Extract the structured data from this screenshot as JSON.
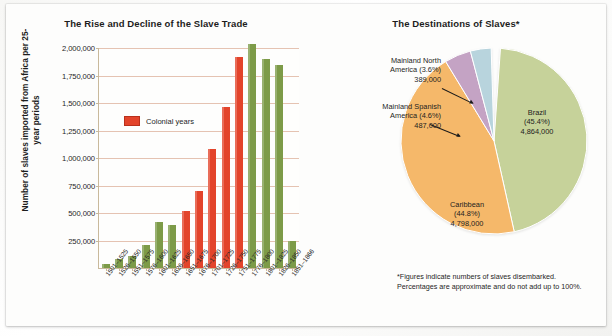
{
  "chart_data": [
    {
      "type": "bar",
      "title": "The Rise and Decline of the Slave Trade",
      "xlabel": "",
      "ylabel": "Number of slaves imported from Africa per 25-year periods",
      "ylim": [
        0,
        2000000
      ],
      "yticks": [
        "250,000",
        "500,000",
        "750,000",
        "1,000,000",
        "1,250,000",
        "1,500,000",
        "1,750,000",
        "2,000,000"
      ],
      "ytick_values": [
        250000,
        500000,
        750000,
        1000000,
        1250000,
        1500000,
        1750000,
        2000000
      ],
      "grid": true,
      "legend": {
        "position": "inside-left",
        "entries": [
          {
            "label": "Colonial years",
            "color": "#e3442b"
          }
        ]
      },
      "categories": [
        "1501–1525",
        "1526–1550",
        "1551–1575",
        "1576–1600",
        "1601–1625",
        "1626–1650",
        "1651–1675",
        "1676–1700",
        "1701–1725",
        "1726–1750",
        "1751–1775",
        "1776–1800",
        "1801–1825",
        "1826–1850",
        "1851–1866"
      ],
      "values": [
        35000,
        80000,
        110000,
        210000,
        420000,
        390000,
        520000,
        700000,
        1080000,
        1460000,
        1920000,
        2040000,
        1900000,
        1850000,
        250000
      ],
      "bar_colors": [
        "#7d9b48",
        "#7d9b48",
        "#7d9b48",
        "#7d9b48",
        "#7d9b48",
        "#7d9b48",
        "#e3442b",
        "#e3442b",
        "#e3442b",
        "#e3442b",
        "#e3442b",
        "#7d9b48",
        "#7d9b48",
        "#7d9b48",
        "#7d9b48"
      ]
    },
    {
      "type": "pie",
      "title": "The Destinations of Slaves*",
      "footnote": "*Figures indicate numbers of slaves disembarked.\nPercentages are approximate and do not add up to 100%.",
      "slices": [
        {
          "name": "Brazil",
          "percent": 45.4,
          "value": "4,864,000",
          "color": "#c6d29a",
          "label": "Brazil\n(45.4%)\n4,864,000"
        },
        {
          "name": "Caribbean",
          "percent": 44.8,
          "value": "4,798,000",
          "color": "#f5b86a",
          "label": "Caribbean\n(44.8%)\n4,798,000"
        },
        {
          "name": "Mainland Spanish America",
          "percent": 4.6,
          "value": "487,000",
          "color": "#c4a3c4",
          "label": "Mainland Spanish\nAmerica (4.6%)\n487,000"
        },
        {
          "name": "Mainland North America",
          "percent": 3.6,
          "value": "389,000",
          "color": "#b8d4dd",
          "label": "Mainland North\nAmerica (3.6%)\n389,000"
        }
      ]
    }
  ],
  "bar_chart": {
    "title": "The Rise and Decline of the Slave Trade",
    "y_axis_label": "Number of slaves imported from Africa per 25-year periods",
    "legend_label": "Colonial years"
  },
  "pie_chart": {
    "title": "The Destinations of Slaves*",
    "footnote_line1": "*Figures indicate numbers of slaves disembarked.",
    "footnote_line2": "Percentages are approximate and do not add up to 100%.",
    "brazil_label": "Brazil\n(45.4%)\n4,864,000",
    "caribbean_label": "Caribbean\n(44.8%)\n4,798,000",
    "spanish_label": "Mainland Spanish\nAmerica (4.6%)\n487,000",
    "north_america_label": "Mainland North\nAmerica (3.6%)\n389,000"
  },
  "colors": {
    "bar_red": "#e3442b",
    "bar_green": "#7d9b48",
    "pie_brazil": "#c6d29a",
    "pie_caribbean": "#f5b86a",
    "pie_spanish": "#c4a3c4",
    "pie_north_america": "#b8d4dd",
    "gridline": "#e0b9a4"
  }
}
